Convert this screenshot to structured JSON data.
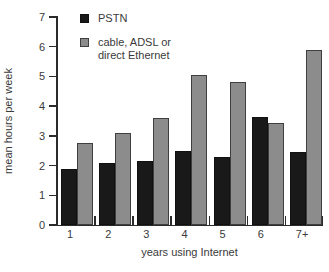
{
  "chart_data": {
    "type": "bar",
    "title": "",
    "xlabel": "years using Internet",
    "ylabel": "mean hours per week",
    "categories": [
      "1",
      "2",
      "3",
      "4",
      "5",
      "6",
      "7+"
    ],
    "ylim": [
      0,
      7
    ],
    "yticks": [
      "0",
      "1",
      "2",
      "3",
      "4",
      "5",
      "6",
      "7"
    ],
    "grid": false,
    "legend_position": "inside-top-left",
    "series": [
      {
        "name": "PSTN",
        "color": "#191919",
        "values": [
          1.9,
          2.1,
          2.15,
          2.5,
          2.3,
          3.65,
          2.45
        ]
      },
      {
        "name": "cable, ADSL or\ndirect Ethernet",
        "color": "#8c8c8c",
        "values": [
          2.75,
          3.1,
          3.6,
          5.05,
          4.8,
          3.45,
          5.9
        ]
      }
    ]
  },
  "legend": {
    "items": [
      {
        "label": "PSTN",
        "swatch": "black-square-swatch"
      },
      {
        "label": "cable, ADSL or\ndirect Ethernet",
        "swatch": "gray-square-swatch"
      }
    ]
  }
}
